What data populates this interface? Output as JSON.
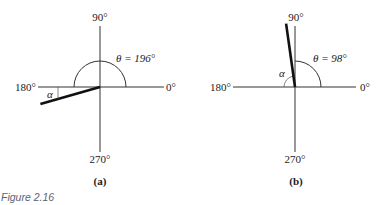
{
  "figure": {
    "caption": "Figure 2.16",
    "panels": [
      {
        "id": "a",
        "sublabel": "(a)",
        "theta_deg": 196,
        "theta_label": "θ = 196°",
        "alpha_label": "α",
        "axis_labels": {
          "right": "0°",
          "top": "90°",
          "left": "180°",
          "bottom": "270°"
        }
      },
      {
        "id": "b",
        "sublabel": "(b)",
        "theta_deg": 98,
        "theta_label": "θ = 98°",
        "alpha_label": "α",
        "axis_labels": {
          "right": "0°",
          "top": "90°",
          "left": "180°",
          "bottom": "270°"
        }
      }
    ]
  }
}
